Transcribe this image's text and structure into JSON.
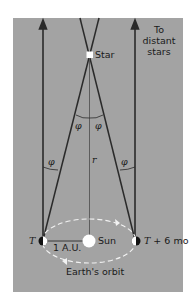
{
  "diagram": {
    "labels": {
      "star": "Star",
      "distant_stars": [
        "To",
        "distant",
        "stars"
      ],
      "phi": "φ",
      "r": "r",
      "t": "T",
      "t6": "T + 6 mo",
      "au": "1 A.U.",
      "sun": "Sun",
      "orbit": "Earth's orbit"
    },
    "colors": {
      "panel": "#a3a3a3",
      "line": "#2a2a2a",
      "orbit": "#f2f2f2",
      "sun": "#ffffff"
    }
  }
}
